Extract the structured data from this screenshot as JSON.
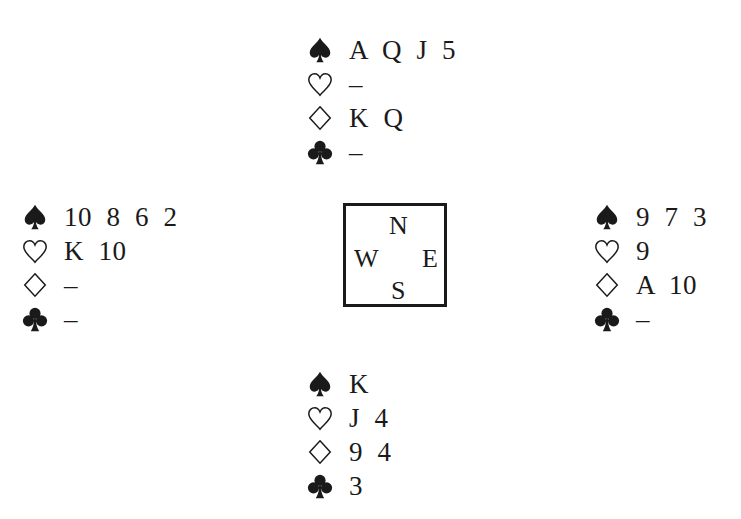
{
  "diagram": {
    "type": "bridge-deal",
    "hands": {
      "north": {
        "spades": "A  Q  J  5",
        "hearts": "–",
        "diamonds": "K  Q",
        "clubs": "–"
      },
      "west": {
        "spades": "10  8  6  2",
        "hearts": "K  10",
        "diamonds": "–",
        "clubs": "–"
      },
      "east": {
        "spades": "9  7  3",
        "hearts": "9",
        "diamonds": "A  10",
        "clubs": "–"
      },
      "south": {
        "spades": "K",
        "hearts": "J  4",
        "diamonds": "9  4",
        "clubs": "3"
      }
    },
    "compass": {
      "n": "N",
      "w": "W",
      "e": "E",
      "s": "S"
    }
  }
}
